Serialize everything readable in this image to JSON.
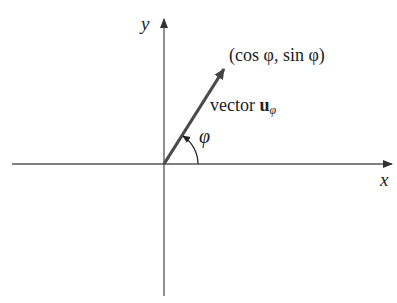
{
  "diagram": {
    "type": "unit-vector-angle",
    "axes": {
      "x_label": "x",
      "y_label": "y"
    },
    "point_label": "(cos φ, sin φ)",
    "vector_label": {
      "prefix": "vector ",
      "symbol": "u",
      "subscript": "φ"
    },
    "angle_label": "φ",
    "colors": {
      "axis": "#555555",
      "vector": "#4a4a4a",
      "text": "#222222",
      "background": "#ffffff"
    }
  }
}
